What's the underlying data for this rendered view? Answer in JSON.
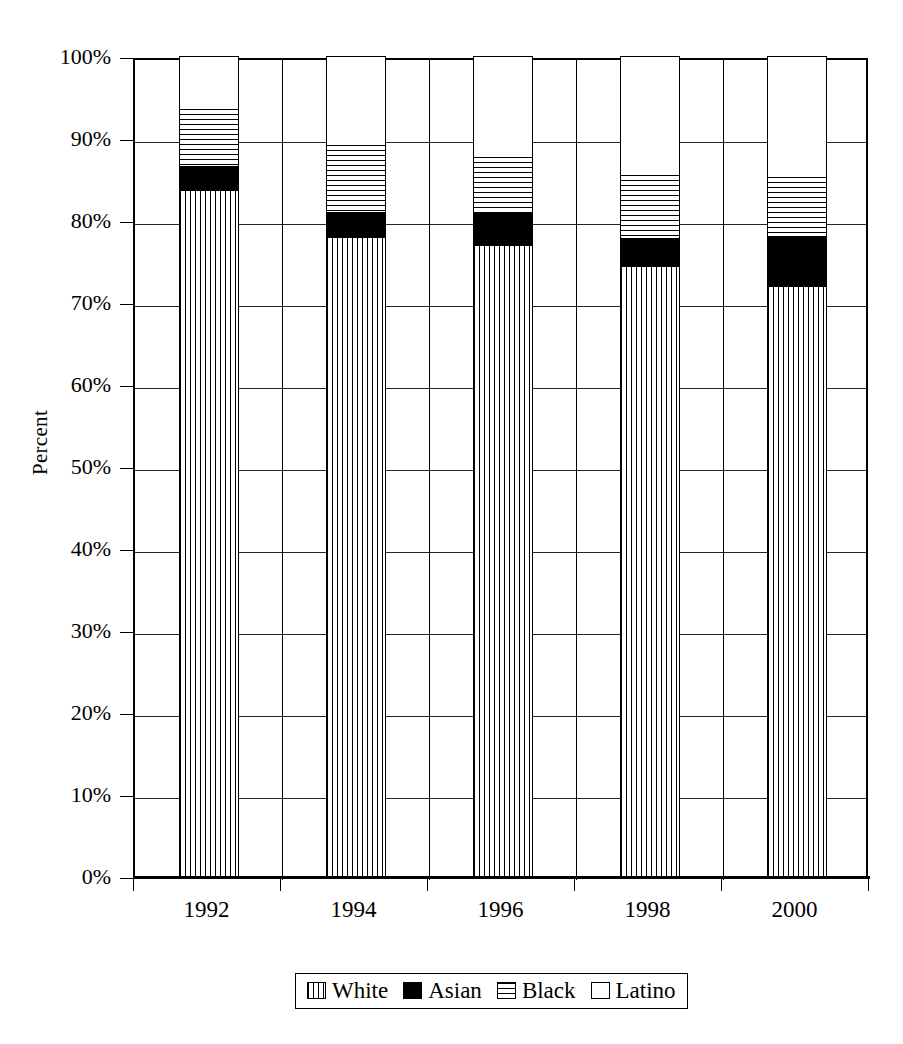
{
  "chart_data": {
    "type": "bar",
    "subtype": "stacked-percent",
    "title": "",
    "xlabel": "",
    "ylabel": "Percent",
    "ylim": [
      0,
      100
    ],
    "y_tick_labels": [
      "0%",
      "10%",
      "20%",
      "30%",
      "40%",
      "50%",
      "60%",
      "70%",
      "80%",
      "90%",
      "100%"
    ],
    "y_tick_values": [
      0,
      10,
      20,
      30,
      40,
      50,
      60,
      70,
      80,
      90,
      100
    ],
    "grid": true,
    "legend_position": "bottom",
    "categories": [
      "1992",
      "1994",
      "1996",
      "1998",
      "2000"
    ],
    "series": [
      {
        "name": "White",
        "pattern": "vertical-hatch",
        "values": [
          83.7,
          77.9,
          77.0,
          74.4,
          72.0
        ]
      },
      {
        "name": "Asian",
        "pattern": "solid-black",
        "values": [
          2.9,
          3.1,
          3.8,
          3.4,
          6.1
        ]
      },
      {
        "name": "Black",
        "pattern": "horizontal-hatch",
        "values": [
          6.9,
          8.1,
          6.9,
          7.7,
          7.2
        ]
      },
      {
        "name": "Latino",
        "pattern": "empty-white",
        "values": [
          6.5,
          10.9,
          12.3,
          14.5,
          14.7
        ]
      }
    ],
    "cumulative_tops": {
      "White": [
        83.7,
        77.9,
        77.0,
        74.4,
        72.0
      ],
      "Asian": [
        86.6,
        81.0,
        80.8,
        77.8,
        78.1
      ],
      "Black": [
        93.5,
        89.1,
        87.7,
        85.5,
        85.3
      ],
      "Latino": [
        100.0,
        100.0,
        100.0,
        100.0,
        100.0
      ]
    }
  },
  "axis": {
    "y_title": "Percent",
    "y_ticks": [
      {
        "label": "100%",
        "value": 100
      },
      {
        "label": "90%",
        "value": 90
      },
      {
        "label": "80%",
        "value": 80
      },
      {
        "label": "70%",
        "value": 70
      },
      {
        "label": "60%",
        "value": 60
      },
      {
        "label": "50%",
        "value": 50
      },
      {
        "label": "40%",
        "value": 40
      },
      {
        "label": "30%",
        "value": 30
      },
      {
        "label": "20%",
        "value": 20
      },
      {
        "label": "10%",
        "value": 10
      },
      {
        "label": "0%",
        "value": 0
      }
    ],
    "x_labels": [
      "1992",
      "1994",
      "1996",
      "1998",
      "2000"
    ]
  },
  "legend": {
    "items": [
      {
        "label": "White",
        "swatch": "vertical-hatch-swatch"
      },
      {
        "label": "Asian",
        "swatch": "solid-black-swatch"
      },
      {
        "label": "Black",
        "swatch": "horizontal-hatch-swatch"
      },
      {
        "label": "Latino",
        "swatch": "empty-white-swatch"
      }
    ]
  },
  "colors": {
    "ink": "#000000",
    "background": "#ffffff"
  }
}
